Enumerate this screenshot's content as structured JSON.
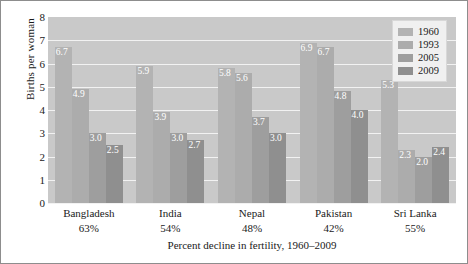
{
  "chart_data": {
    "type": "bar",
    "title": "",
    "xlabel": "Percent decline in fertility, 1960–2009",
    "ylabel": "Births per woman",
    "ylim": [
      0,
      8
    ],
    "yticks": [
      "8",
      "7",
      "6",
      "5",
      "4",
      "3",
      "2",
      "1",
      "0"
    ],
    "grid": true,
    "legend_position": "top-right",
    "categories": [
      "Bangladesh",
      "India",
      "Nepal",
      "Pakistan",
      "Sri Lanka"
    ],
    "category_sublabels": [
      "63%",
      "54%",
      "48%",
      "42%",
      "55%"
    ],
    "series": [
      {
        "name": "1960",
        "color": "#b3b3b3",
        "values": [
          6.7,
          5.9,
          5.8,
          6.9,
          5.3
        ]
      },
      {
        "name": "1993",
        "color": "#acacac",
        "values": [
          4.9,
          3.9,
          5.6,
          6.7,
          2.3
        ]
      },
      {
        "name": "2005",
        "color": "#9e9e9e",
        "values": [
          3.0,
          3.0,
          3.7,
          4.8,
          2.0
        ]
      },
      {
        "name": "2009",
        "color": "#8f8f8f",
        "values": [
          2.5,
          2.7,
          3.0,
          4.0,
          2.4
        ]
      }
    ],
    "value_labels": [
      [
        "6.7",
        "4.9",
        "3.0",
        "2.5"
      ],
      [
        "5.9",
        "3.9",
        "3.0",
        "2.7"
      ],
      [
        "5.8",
        "5.6",
        "3.7",
        "3.0"
      ],
      [
        "6.9",
        "6.7",
        "4.8",
        "4.0"
      ],
      [
        "5.3",
        "2.3",
        "2.0",
        "2.4"
      ]
    ],
    "plot_background": "#c9c9c9",
    "gridline_color": "#f2f2f2",
    "value_label_color": "#ffffff"
  }
}
